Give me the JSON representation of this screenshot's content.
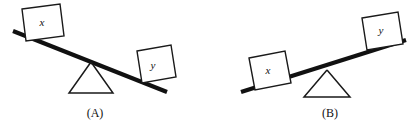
{
  "figure": {
    "background_color": "#ffffff",
    "ink_color": "#111111",
    "width": 417,
    "height": 130,
    "panels": [
      {
        "id": "panel-a",
        "caption": "(A)",
        "caption_x": 95,
        "caption_y": 113,
        "tilt": "down-right",
        "plank": {
          "x1": 13,
          "y1": 31,
          "x2": 167,
          "y2": 92
        },
        "fulcrum": {
          "apex_x": 91,
          "apex_y": 62,
          "base_left_x": 69,
          "base_right_x": 113,
          "base_y": 93
        },
        "blocks": [
          {
            "label": "x",
            "side": "left",
            "elevation": "high",
            "label_x": 42,
            "label_y": 22,
            "points": "22,9 60,4 64,36 26,41"
          },
          {
            "label": "y",
            "side": "right",
            "elevation": "low",
            "label_x": 153,
            "label_y": 65,
            "points": "137,51 171,45 176,77 142,83"
          }
        ]
      },
      {
        "id": "panel-b",
        "caption": "(B)",
        "caption_x": 330,
        "caption_y": 113,
        "tilt": "up-right",
        "plank": {
          "x1": 241,
          "y1": 92,
          "x2": 406,
          "y2": 40
        },
        "fulcrum": {
          "apex_x": 327,
          "apex_y": 70,
          "base_left_x": 304,
          "base_right_x": 350,
          "base_y": 97
        },
        "blocks": [
          {
            "label": "x",
            "side": "left",
            "elevation": "low",
            "label_x": 268,
            "label_y": 70,
            "points": "249,58 285,51 291,83 255,90"
          },
          {
            "label": "y",
            "side": "right",
            "elevation": "high",
            "label_x": 381,
            "label_y": 30,
            "points": "362,18 398,12 403,44 367,50"
          }
        ]
      }
    ]
  }
}
